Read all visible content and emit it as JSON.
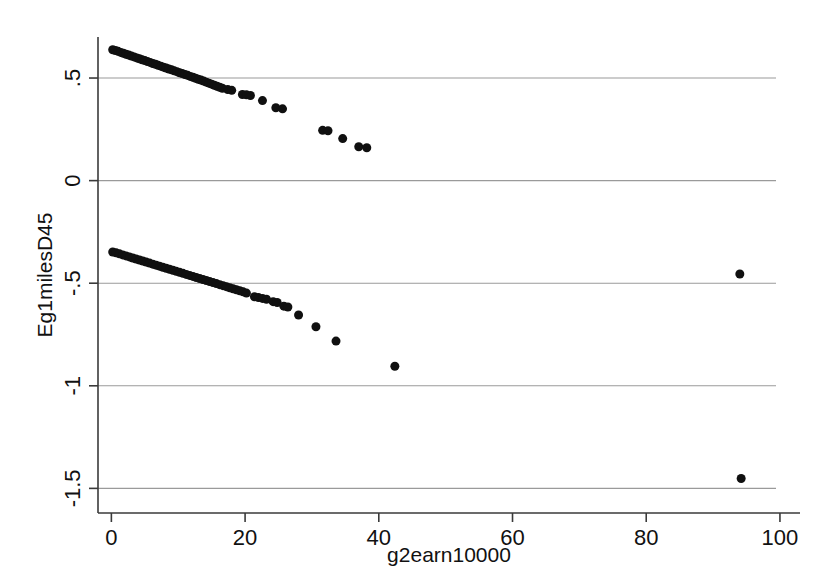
{
  "chart_data": {
    "type": "scatter",
    "title": "",
    "xlabel": "g2earn10000",
    "ylabel": "Eg1milesD45",
    "xlim": [
      -2,
      103
    ],
    "ylim": [
      -1.62,
      0.7
    ],
    "grid": true,
    "grid_axis": "y",
    "legend": null,
    "marker": {
      "shape": "circle",
      "color": "#101010",
      "size_px": 9
    },
    "xticks": [
      0,
      20,
      40,
      60,
      80,
      100
    ],
    "xtick_labels": [
      "0",
      "20",
      "40",
      "60",
      "80",
      "100"
    ],
    "yticks": [
      0.5,
      0,
      -0.5,
      -1,
      -1.5
    ],
    "ytick_labels": [
      ".5",
      "0",
      "-.5",
      "-1",
      "-1.5"
    ],
    "series": [
      {
        "name": "upper-branch",
        "description": "Dense descending band from origin plus sparse tail",
        "points": [
          [
            0.2,
            0.638
          ],
          [
            0.6,
            0.634
          ],
          [
            1.0,
            0.63
          ],
          [
            1.4,
            0.625
          ],
          [
            1.8,
            0.621
          ],
          [
            2.2,
            0.616
          ],
          [
            2.6,
            0.612
          ],
          [
            3.0,
            0.607
          ],
          [
            3.4,
            0.603
          ],
          [
            3.8,
            0.598
          ],
          [
            4.2,
            0.594
          ],
          [
            4.6,
            0.589
          ],
          [
            5.0,
            0.585
          ],
          [
            5.4,
            0.58
          ],
          [
            5.8,
            0.576
          ],
          [
            6.2,
            0.571
          ],
          [
            6.6,
            0.567
          ],
          [
            7.0,
            0.562
          ],
          [
            7.4,
            0.558
          ],
          [
            7.8,
            0.553
          ],
          [
            8.2,
            0.549
          ],
          [
            8.6,
            0.544
          ],
          [
            9.0,
            0.54
          ],
          [
            9.4,
            0.535
          ],
          [
            9.8,
            0.531
          ],
          [
            10.2,
            0.526
          ],
          [
            10.6,
            0.522
          ],
          [
            11.0,
            0.517
          ],
          [
            11.4,
            0.513
          ],
          [
            11.8,
            0.508
          ],
          [
            12.2,
            0.504
          ],
          [
            12.6,
            0.499
          ],
          [
            13.0,
            0.494
          ],
          [
            13.4,
            0.49
          ],
          [
            13.8,
            0.485
          ],
          [
            14.2,
            0.48
          ],
          [
            14.6,
            0.475
          ],
          [
            15.0,
            0.47
          ],
          [
            15.4,
            0.465
          ],
          [
            15.8,
            0.46
          ],
          [
            16.2,
            0.455
          ],
          [
            16.6,
            0.45
          ],
          [
            17.4,
            0.444
          ],
          [
            18.0,
            0.44
          ],
          [
            19.6,
            0.42
          ],
          [
            20.2,
            0.418
          ],
          [
            20.8,
            0.415
          ],
          [
            22.6,
            0.39
          ],
          [
            24.6,
            0.355
          ],
          [
            25.6,
            0.35
          ],
          [
            31.6,
            0.245
          ],
          [
            32.4,
            0.243
          ],
          [
            34.6,
            0.205
          ],
          [
            37.0,
            0.165
          ],
          [
            38.2,
            0.16
          ]
        ]
      },
      {
        "name": "lower-branch",
        "description": "Dense descending band starting near -0.35 plus sparse tail and far outliers",
        "points": [
          [
            0.2,
            -0.348
          ],
          [
            0.7,
            -0.352
          ],
          [
            1.2,
            -0.357
          ],
          [
            1.7,
            -0.362
          ],
          [
            2.2,
            -0.367
          ],
          [
            2.7,
            -0.372
          ],
          [
            3.2,
            -0.377
          ],
          [
            3.7,
            -0.382
          ],
          [
            4.2,
            -0.387
          ],
          [
            4.7,
            -0.392
          ],
          [
            5.2,
            -0.397
          ],
          [
            5.7,
            -0.402
          ],
          [
            6.2,
            -0.407
          ],
          [
            6.7,
            -0.412
          ],
          [
            7.2,
            -0.417
          ],
          [
            7.7,
            -0.422
          ],
          [
            8.2,
            -0.427
          ],
          [
            8.7,
            -0.432
          ],
          [
            9.2,
            -0.437
          ],
          [
            9.7,
            -0.442
          ],
          [
            10.2,
            -0.447
          ],
          [
            10.7,
            -0.452
          ],
          [
            11.2,
            -0.457
          ],
          [
            11.7,
            -0.462
          ],
          [
            12.2,
            -0.467
          ],
          [
            12.7,
            -0.472
          ],
          [
            13.2,
            -0.477
          ],
          [
            13.7,
            -0.482
          ],
          [
            14.2,
            -0.487
          ],
          [
            14.7,
            -0.492
          ],
          [
            15.2,
            -0.497
          ],
          [
            15.7,
            -0.502
          ],
          [
            16.2,
            -0.507
          ],
          [
            16.7,
            -0.512
          ],
          [
            17.2,
            -0.517
          ],
          [
            17.7,
            -0.522
          ],
          [
            18.2,
            -0.527
          ],
          [
            18.7,
            -0.532
          ],
          [
            19.2,
            -0.537
          ],
          [
            19.7,
            -0.542
          ],
          [
            20.2,
            -0.548
          ],
          [
            21.4,
            -0.566
          ],
          [
            22.0,
            -0.57
          ],
          [
            22.6,
            -0.574
          ],
          [
            23.2,
            -0.578
          ],
          [
            24.2,
            -0.59
          ],
          [
            24.8,
            -0.594
          ],
          [
            25.8,
            -0.612
          ],
          [
            26.4,
            -0.616
          ],
          [
            28.0,
            -0.655
          ],
          [
            30.6,
            -0.712
          ],
          [
            33.6,
            -0.782
          ],
          [
            42.4,
            -0.905
          ],
          [
            94.0,
            -0.455
          ],
          [
            94.2,
            -1.452
          ]
        ]
      }
    ],
    "notes": [
      "Two distinct descending point bands separated by a gap near y = 0",
      "Two far-right outliers at x ≈ 94"
    ]
  },
  "colors": {
    "background": "#ffffff",
    "point": "#101010",
    "gridline": "#9a9a9a",
    "axis": "#3a3a3a",
    "text": "#111111"
  }
}
